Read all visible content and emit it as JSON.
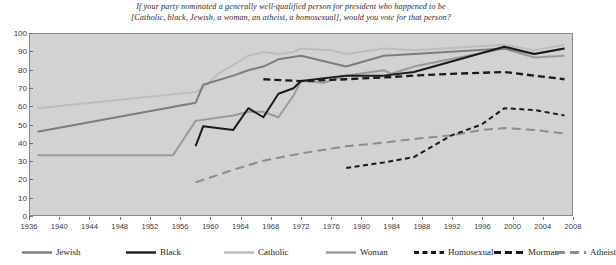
{
  "chart_data": {
    "type": "line",
    "title": "If your party nominated a generally well-qualified person for president who happened to be [Catholic, black, Jewish, a woman, an atheist, a homosexual], would you vote for that person?",
    "title_line1": "If your party nominated a generally well-qualified person for president who happened to be",
    "title_line2": "[Catholic, black, Jewish, a woman, an atheist, a homosexual], would you vote for that person?",
    "xlabel": "",
    "ylabel": "",
    "xlim": [
      1936,
      2008
    ],
    "ylim": [
      0,
      100
    ],
    "grid": "horizontal-bands",
    "legend_position": "bottom",
    "xticks": [
      1936,
      1940,
      1944,
      1948,
      1952,
      1956,
      1960,
      1964,
      1968,
      1972,
      1976,
      1980,
      1984,
      1988,
      1992,
      1996,
      2000,
      2004,
      2008
    ],
    "yticks": [
      0,
      10,
      20,
      30,
      40,
      50,
      60,
      70,
      80,
      90,
      100
    ],
    "series": [
      {
        "name": "Jewish",
        "color": "#7d7d7d",
        "style": "solid",
        "width": 2.0,
        "points": [
          [
            1937,
            46
          ],
          [
            1958,
            62
          ],
          [
            1959,
            72
          ],
          [
            1963,
            77
          ],
          [
            1965,
            80
          ],
          [
            1967,
            82
          ],
          [
            1969,
            86
          ],
          [
            1972,
            88
          ],
          [
            1978,
            82
          ],
          [
            1983,
            88
          ],
          [
            1987,
            89
          ],
          [
            1999,
            92
          ],
          [
            2003,
            89
          ],
          [
            2007,
            92
          ]
        ]
      },
      {
        "name": "Black",
        "color": "#1a1a1a",
        "style": "solid",
        "width": 2.0,
        "points": [
          [
            1958,
            38
          ],
          [
            1959,
            49
          ],
          [
            1963,
            47
          ],
          [
            1965,
            59
          ],
          [
            1967,
            54
          ],
          [
            1969,
            67
          ],
          [
            1971,
            70
          ],
          [
            1972,
            74
          ],
          [
            1978,
            77
          ],
          [
            1983,
            77
          ],
          [
            1987,
            79
          ],
          [
            1999,
            93
          ],
          [
            2003,
            89
          ],
          [
            2007,
            92
          ]
        ]
      },
      {
        "name": "Catholic",
        "color": "#bdbdbd",
        "style": "solid",
        "width": 2.0,
        "points": [
          [
            1937,
            59
          ],
          [
            1958,
            68
          ],
          [
            1959,
            70
          ],
          [
            1961,
            78
          ],
          [
            1963,
            83
          ],
          [
            1965,
            88
          ],
          [
            1967,
            90
          ],
          [
            1969,
            89
          ],
          [
            1971,
            90
          ],
          [
            1972,
            92
          ],
          [
            1976,
            91
          ],
          [
            1978,
            89
          ],
          [
            1983,
            92
          ],
          [
            1987,
            91
          ],
          [
            1999,
            94
          ],
          [
            2003,
            91
          ],
          [
            2007,
            94
          ]
        ]
      },
      {
        "name": "Woman",
        "color": "#9a9a9a",
        "style": "solid",
        "width": 2.0,
        "points": [
          [
            1937,
            33
          ],
          [
            1949,
            33
          ],
          [
            1955,
            33
          ],
          [
            1958,
            52
          ],
          [
            1963,
            55
          ],
          [
            1965,
            57
          ],
          [
            1967,
            57
          ],
          [
            1969,
            54
          ],
          [
            1971,
            66
          ],
          [
            1972,
            74
          ],
          [
            1975,
            73
          ],
          [
            1978,
            77
          ],
          [
            1983,
            80
          ],
          [
            1984,
            78
          ],
          [
            1987,
            82
          ],
          [
            1999,
            92
          ],
          [
            2003,
            87
          ],
          [
            2007,
            88
          ]
        ]
      },
      {
        "name": "Homosexual",
        "color": "#1a1a1a",
        "style": "dashed",
        "dash": "5,3.5",
        "width": 2.0,
        "points": [
          [
            1978,
            26
          ],
          [
            1983,
            29
          ],
          [
            1987,
            32
          ],
          [
            1992,
            44
          ],
          [
            1996,
            50
          ],
          [
            1999,
            59
          ],
          [
            2003,
            58
          ],
          [
            2007,
            55
          ]
        ]
      },
      {
        "name": "Morman",
        "color": "#1a1a1a",
        "style": "dashed",
        "dash": "7,4",
        "width": 2.3,
        "points": [
          [
            1967,
            75
          ],
          [
            1972,
            74
          ],
          [
            1978,
            75
          ],
          [
            1983,
            76
          ],
          [
            1987,
            77
          ],
          [
            1992,
            78
          ],
          [
            1999,
            79
          ],
          [
            2003,
            77
          ],
          [
            2007,
            75
          ]
        ]
      },
      {
        "name": "Atheist",
        "color": "#8c8c8c",
        "style": "dashed",
        "dash": "9,5",
        "width": 2.0,
        "points": [
          [
            1958,
            18
          ],
          [
            1963,
            25
          ],
          [
            1967,
            30
          ],
          [
            1972,
            34
          ],
          [
            1978,
            38
          ],
          [
            1983,
            40
          ],
          [
            1987,
            42
          ],
          [
            1992,
            44
          ],
          [
            1996,
            47
          ],
          [
            1999,
            48
          ],
          [
            2003,
            47
          ],
          [
            2007,
            45
          ]
        ]
      }
    ],
    "legend": [
      {
        "label": "Jewish",
        "color": "#7d7d7d",
        "style": "solid"
      },
      {
        "label": "Black",
        "color": "#1a1a1a",
        "style": "solid"
      },
      {
        "label": "Catholic",
        "color": "#bdbdbd",
        "style": "solid"
      },
      {
        "label": "Woman",
        "color": "#9a9a9a",
        "style": "solid"
      },
      {
        "label": "Homosexual",
        "color": "#1a1a1a",
        "style": "dashed",
        "dash": "5,3.5"
      },
      {
        "label": "Morman",
        "color": "#1a1a1a",
        "style": "dashed",
        "dash": "7,4"
      },
      {
        "label": "Atheist",
        "color": "#8c8c8c",
        "style": "dashed",
        "dash": "9,5"
      }
    ]
  },
  "colors": {
    "plot_background": "#ededed",
    "band": "#d2d2d2",
    "axis": "#6d6d6d",
    "text": "#2b2b2b"
  }
}
